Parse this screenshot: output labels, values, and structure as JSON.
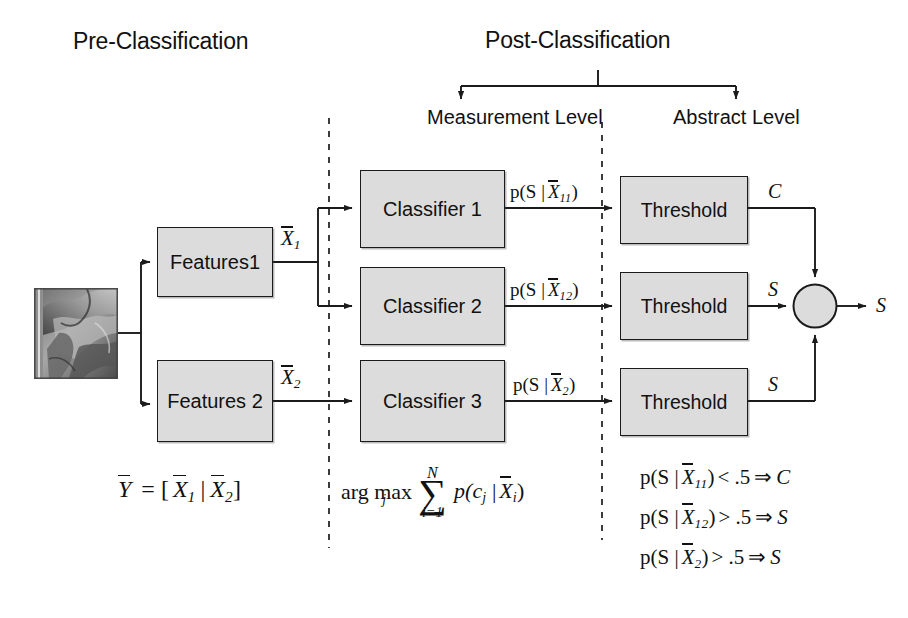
{
  "figure": {
    "title_left": "Pre-Classification",
    "title_right": "Post-Classification",
    "level_left": "Measurement Level",
    "level_right": "Abstract Level"
  },
  "nodes": {
    "input_image_alt": "input-image-thumbnail",
    "features": [
      {
        "label": "Features1"
      },
      {
        "label": "Features 2"
      }
    ],
    "classifiers": [
      {
        "label": "Classifier 1"
      },
      {
        "label": "Classifier 2"
      },
      {
        "label": "Classifier 3"
      }
    ],
    "thresholds": [
      {
        "label": "Threshold"
      },
      {
        "label": "Threshold"
      },
      {
        "label": "Threshold"
      }
    ],
    "fusion": {
      "label": "",
      "name": "fusion-junction"
    }
  },
  "edge_labels": {
    "feature_vectors": [
      {
        "base": "X",
        "sub": "1"
      },
      {
        "base": "X",
        "sub": "2"
      }
    ],
    "posteriors": [
      {
        "prefix": "p(S |",
        "base": "X",
        "sub": "11",
        "suffix": ")"
      },
      {
        "prefix": "p(S |",
        "base": "X",
        "sub": "12",
        "suffix": ")"
      },
      {
        "prefix": "p(S |",
        "base": "X",
        "sub": "2",
        "suffix": ")"
      }
    ],
    "decisions": [
      "C",
      "S",
      "S"
    ],
    "output": "S"
  },
  "formulas": {
    "concat": {
      "lhs_base": "Y",
      "eq": "= [",
      "x1_base": "X",
      "x1_sub": "1",
      "mid": "|",
      "x2_base": "X",
      "x2_sub": "2",
      "close": "]"
    },
    "argmax": {
      "arg": "arg max",
      "arg_sub": "j",
      "sum_top": "N",
      "sum_bottom": "i=1",
      "term_prefix": "p(c",
      "term_sub1": "j",
      "term_mid": " |",
      "term_base": "X",
      "term_sub2": "i",
      "term_suffix": ")"
    },
    "rules": [
      {
        "prefix": "p(S |",
        "base": "X",
        "sub": "11",
        "close": ")",
        "cmp": "< .5",
        "arrow": "⇒",
        "result": "C"
      },
      {
        "prefix": "p(S |",
        "base": "X",
        "sub": "12",
        "close": ")",
        "cmp": "> .5",
        "arrow": "⇒",
        "result": "S"
      },
      {
        "prefix": "p(S  |",
        "base": "X",
        "sub": "2",
        "close": ")",
        "cmp": "> .5",
        "arrow": "⇒",
        "result": "S"
      }
    ]
  },
  "colors": {
    "box_fill": "#dcdcdc",
    "box_stroke": "#1b1b1b",
    "wire": "#1b1b1b",
    "divider": "#1b1b1b",
    "text": "#111111"
  }
}
